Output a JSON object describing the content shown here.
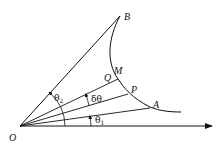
{
  "figure": {
    "type": "polar-curve-geometry",
    "points": {
      "O": {
        "label": "O"
      },
      "A": {
        "label": "A"
      },
      "B": {
        "label": "B"
      },
      "P": {
        "label": "P"
      },
      "Q": {
        "label": "Q"
      },
      "M": {
        "label": "M"
      }
    },
    "angles": {
      "theta1": {
        "symbol": "θ",
        "sub": "1"
      },
      "theta2": {
        "symbol": "θ",
        "sub": "2"
      },
      "delta_theta": {
        "symbol": "δθ"
      }
    },
    "colors": {
      "stroke": "#111111",
      "background": "#ffffff"
    }
  }
}
